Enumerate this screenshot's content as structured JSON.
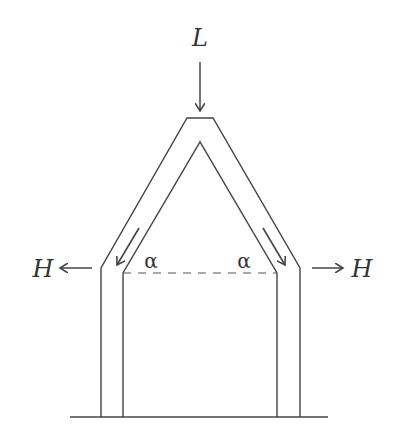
{
  "diagram": {
    "type": "structural-free-body",
    "labels": {
      "load": "L",
      "horizontal_left": "H",
      "horizontal_right": "H",
      "angle_left": "α",
      "angle_right": "α"
    },
    "colors": {
      "stroke": "#444444",
      "background": "#ffffff",
      "text": "#333333"
    },
    "forces": [
      {
        "name": "L",
        "direction": "down",
        "location": "apex"
      },
      {
        "name": "H",
        "direction": "left",
        "location": "left shoulder"
      },
      {
        "name": "H",
        "direction": "right",
        "location": "right shoulder"
      },
      {
        "name": "rafter-thrust-left",
        "direction": "down-left along rafter"
      },
      {
        "name": "rafter-thrust-right",
        "direction": "down-right along rafter"
      }
    ]
  }
}
